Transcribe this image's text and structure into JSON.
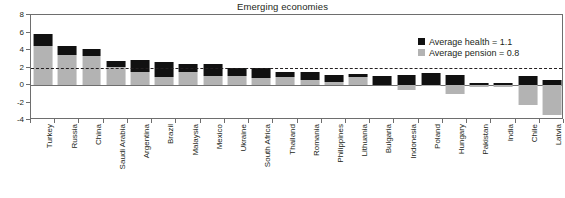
{
  "chart_data": {
    "type": "bar",
    "subtype": "stacked-bar-with-negative-values",
    "title": "Emerging economies",
    "xlabel": "",
    "ylabel": "",
    "ylim": [
      -4,
      8
    ],
    "yticks": [
      -4,
      -2,
      0,
      2,
      4,
      6,
      8
    ],
    "grid": false,
    "legend_position": "top-right",
    "reference_line": {
      "value": 2,
      "style": "dashed",
      "color": "#231f20"
    },
    "categories": [
      "Turkey",
      "Russia",
      "China",
      "Saudi Arabia",
      "Argentina",
      "Brazil",
      "Malaysia",
      "Mexico",
      "Ukraine",
      "South Africa",
      "Thailand",
      "Romania",
      "Philippines",
      "Lithuania",
      "Bulgaria",
      "Indonesia",
      "Poland",
      "Hungary",
      "Pakistan",
      "India",
      "Chile",
      "Latvia"
    ],
    "series": [
      {
        "name": "Average pension = 0.8",
        "key": "pension",
        "color": "#b3b3b3",
        "values": [
          4.5,
          3.4,
          3.3,
          2.1,
          1.5,
          0.9,
          1.5,
          1.0,
          1.0,
          0.8,
          0.9,
          0.6,
          0.4,
          0.9,
          0.0,
          -0.6,
          -0.1,
          -1.0,
          -0.2,
          -0.2,
          -2.3,
          -3.4
        ]
      },
      {
        "name": "Average health = 1.1",
        "key": "health",
        "color": "#111111",
        "values": [
          1.3,
          1.1,
          0.8,
          0.7,
          1.4,
          1.7,
          0.9,
          1.4,
          1.0,
          1.2,
          0.6,
          0.9,
          0.8,
          0.4,
          1.0,
          1.1,
          1.4,
          1.2,
          0.2,
          0.2,
          1.0,
          0.6
        ]
      }
    ],
    "legend": [
      {
        "label": "Average health = 1.1",
        "color": "#111111",
        "key": "health"
      },
      {
        "label": "Average pension = 0.8",
        "color": "#b3b3b3",
        "key": "pension"
      }
    ]
  }
}
